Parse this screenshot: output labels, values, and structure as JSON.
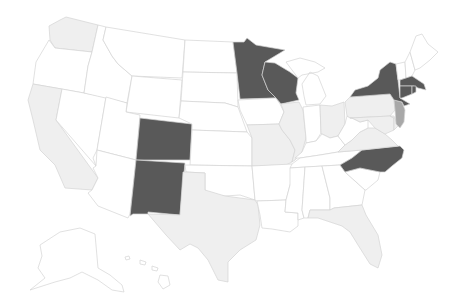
{
  "map": {
    "type": "choropleth",
    "region": "United States",
    "legend": null
  },
  "palette": {
    "dark": "#595959",
    "medium": "#a8a8a8",
    "light": "#efefef",
    "none": "#ffffff",
    "border": "#d4d4d4"
  },
  "states": [
    {
      "id": "WA",
      "category": "light",
      "d": "M60,20 L66,17 L98,25 L92,52 L55,48 L50,40 L49,26 Z"
    },
    {
      "id": "OR",
      "category": "none",
      "d": "M49,40 L55,48 L92,52 L88,66 L84,93 L33,84 L36,62 Z"
    },
    {
      "id": "CA",
      "category": "light",
      "d": "M33,84 L62,89 L56,120 L98,178 L92,190 L65,188 L55,165 L40,150 L33,120 L28,100 Z"
    },
    {
      "id": "NV",
      "category": "none",
      "d": "M62,89 L106,97 L97,150 L93,158 L96,166 L56,120 Z"
    },
    {
      "id": "ID",
      "category": "none",
      "d": "M98,25 L106,27 L103,40 L112,56 L118,64 L132,76 L127,103 L84,93 L88,66 L92,52 Z"
    },
    {
      "id": "MT",
      "category": "none",
      "d": "M106,27 L185,40 L182,78 L132,76 L118,64 L112,56 L103,40 Z"
    },
    {
      "id": "WY",
      "category": "none",
      "d": "M132,76 L182,80 L179,118 L126,112 Z"
    },
    {
      "id": "UT",
      "category": "none",
      "d": "M106,97 L127,103 L126,112 L140,115 L136,160 L97,150 Z"
    },
    {
      "id": "AZ",
      "category": "none",
      "d": "M97,150 L136,160 L130,214 L128,218 L98,206 L88,193 L92,190 L98,178 L93,168 L96,166 Z"
    },
    {
      "id": "CO",
      "category": "dark",
      "d": "M140,118 L192,124 L190,160 L136,160 Z"
    },
    {
      "id": "NM",
      "category": "dark",
      "d": "M136,160 L185,163 L180,215 L148,212 L148,214 L133,214 L130,216 Z"
    },
    {
      "id": "ND",
      "category": "none",
      "d": "M185,40 L233,42 L237,73 L183,72 Z"
    },
    {
      "id": "SD",
      "category": "none",
      "d": "M183,72 L237,73 L238,107 L225,103 L181,101 Z"
    },
    {
      "id": "NE",
      "category": "none",
      "d": "M181,101 L225,103 L238,107 L247,132 L192,130 L192,124 L179,118 Z"
    },
    {
      "id": "KS",
      "category": "none",
      "d": "M192,130 L247,132 L252,138 L252,166 L190,165 Z"
    },
    {
      "id": "OK",
      "category": "none",
      "d": "M185,165 L252,166 L255,200 L240,195 L225,196 L210,195 L205,190 L205,173 L186,172 Z"
    },
    {
      "id": "TX",
      "category": "light",
      "d": "M186,172 L205,173 L205,190 L225,196 L255,200 L258,205 L260,225 L256,240 L240,250 L228,262 L228,282 L218,280 L208,260 L198,248 L190,244 L180,250 L166,235 L148,214 L180,215 L183,172 Z"
    },
    {
      "id": "MN",
      "category": "dark",
      "d": "M233,42 L244,42 L247,38 L256,45 L285,50 L265,62 L262,75 L268,90 L276,98 L240,99 L237,73 Z"
    },
    {
      "id": "IA",
      "category": "none",
      "d": "M238,100 L276,98 L280,104 L284,112 L279,124 L247,125 L240,110 Z"
    },
    {
      "id": "MO",
      "category": "light",
      "d": "M247,125 L279,124 L282,130 L290,140 L295,150 L292,162 L286,165 L252,166 L252,138 Z"
    },
    {
      "id": "AR",
      "category": "none",
      "d": "M252,166 L292,164 L296,168 L290,185 L286,200 L257,201 L255,200 Z"
    },
    {
      "id": "LA",
      "category": "none",
      "d": "M257,201 L286,200 L285,212 L298,213 L298,226 L290,232 L272,229 L262,228 L260,215 Z"
    },
    {
      "id": "WI",
      "category": "dark",
      "d": "M265,62 L275,63 L290,72 L298,78 L296,93 L299,100 L281,104 L276,98 L268,90 L262,75 Z"
    },
    {
      "id": "IL",
      "category": "light",
      "d": "M281,104 L299,102 L303,110 L306,138 L302,152 L295,160 L292,162 L295,150 L290,140 L282,130 L279,124 L284,112 Z"
    },
    {
      "id": "MI",
      "category": "none",
      "d": "M286,62 L300,58 L315,62 L325,68 L318,72 L302,75 L298,78 Z M302,84 L310,72 L318,76 L322,86 L326,96 L320,104 L306,105 L304,96 Z"
    },
    {
      "id": "IN",
      "category": "none",
      "d": "M303,107 L320,105 L321,133 L316,141 L306,143 L306,138 Z"
    },
    {
      "id": "OH",
      "category": "light",
      "d": "M320,105 L332,106 L344,102 L345,124 L338,136 L330,138 L322,134 L321,133 Z"
    },
    {
      "id": "KY",
      "category": "none",
      "d": "M295,158 L302,152 L306,143 L316,141 L322,134 L330,138 L338,136 L345,145 L338,152 L320,155 L300,158 Z"
    },
    {
      "id": "TN",
      "category": "none",
      "d": "M292,164 L300,158 L320,155 L338,152 L362,150 L352,158 L340,165 L290,168 Z"
    },
    {
      "id": "MS",
      "category": "none",
      "d": "M290,168 L305,167 L302,210 L304,218 L298,220 L298,213 L285,212 L286,200 L290,185 Z"
    },
    {
      "id": "AL",
      "category": "none",
      "d": "M305,167 L322,166 L330,198 L330,210 L310,210 L308,218 L304,218 L302,210 Z"
    },
    {
      "id": "GA",
      "category": "none",
      "d": "M322,166 L340,165 L345,172 L365,190 L362,205 L334,208 L330,210 L330,198 Z"
    },
    {
      "id": "FL",
      "category": "light",
      "d": "M310,210 L330,210 L334,208 L362,205 L366,215 L378,235 L382,255 L378,268 L370,264 L358,245 L350,232 L342,226 L330,222 L318,218 L308,218 Z"
    },
    {
      "id": "SC",
      "category": "none",
      "d": "M345,172 L360,168 L380,172 L378,180 L366,190 L365,190 Z"
    },
    {
      "id": "NC",
      "category": "dark",
      "d": "M340,165 L352,158 L362,150 L400,146 L404,150 L402,158 L392,166 L385,172 L380,172 L360,168 L345,172 Z"
    },
    {
      "id": "VA",
      "category": "light",
      "d": "M338,152 L345,145 L352,140 L360,132 L368,128 L375,128 L385,134 L392,140 L398,146 L362,150 Z"
    },
    {
      "id": "WV",
      "category": "none",
      "d": "M338,136 L345,124 L347,116 L352,118 L360,122 L368,120 L368,128 L360,132 L352,140 L345,145 Z"
    },
    {
      "id": "PA",
      "category": "light",
      "d": "M345,102 L350,97 L390,94 L394,100 L395,110 L390,116 L350,118 L347,116 Z"
    },
    {
      "id": "MD",
      "category": "light",
      "d": "M350,118 L390,116 L394,118 L394,130 L385,134 L375,128 L368,120 L360,122 L352,118 Z"
    },
    {
      "id": "DE",
      "category": "light",
      "d": "M390,116 L394,116 L398,126 L394,130 L394,118 Z"
    },
    {
      "id": "NJ",
      "category": "medium",
      "d": "M394,100 L402,102 L405,110 L404,122 L400,128 L396,124 L395,110 Z"
    },
    {
      "id": "NY",
      "category": "dark",
      "d": "M350,97 L355,90 L368,86 L378,78 L380,70 L390,62 L396,64 L398,80 L400,98 L410,104 L404,106 L402,102 L394,100 L390,94 Z"
    },
    {
      "id": "VT",
      "category": "none",
      "d": "M396,64 L405,62 L406,78 L400,80 L398,80 Z"
    },
    {
      "id": "NH",
      "category": "none",
      "d": "M405,62 L410,52 L415,70 L412,76 L406,78 Z"
    },
    {
      "id": "ME",
      "category": "none",
      "d": "M410,52 L416,36 L422,34 L428,44 L438,52 L430,60 L420,68 L415,70 Z"
    },
    {
      "id": "MA",
      "category": "dark",
      "d": "M400,80 L406,78 L412,76 L418,80 L424,84 L426,90 L418,88 L414,86 L400,86 Z"
    },
    {
      "id": "CT",
      "category": "dark",
      "d": "M400,86 L412,86 L412,94 L402,98 L400,98 Z"
    },
    {
      "id": "RI",
      "category": "dark",
      "d": "M412,86 L416,86 L416,92 L412,94 Z"
    },
    {
      "id": "AK",
      "category": "none",
      "d": "M40,245 L60,232 L80,228 L95,234 L98,268 L110,275 L122,285 L124,292 L112,290 L98,280 L82,272 L70,278 L55,282 L30,290 L45,278 L38,268 L42,256 Z"
    },
    {
      "id": "HI",
      "category": "none",
      "d": "M125,257 L129,256 L130,259 L126,260 Z M140,260 L146,262 L145,265 L140,264 Z M152,266 L158,268 L157,271 L152,270 Z M160,275 L168,276 L170,285 L163,289 L158,282 Z"
    }
  ]
}
